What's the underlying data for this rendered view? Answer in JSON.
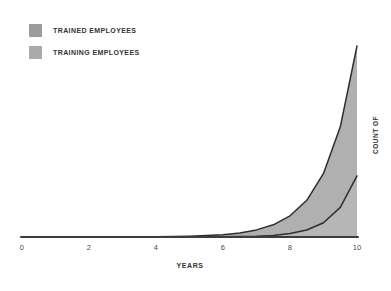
{
  "legend": {
    "items": [
      {
        "label": "TRAINED EMPLOYEES",
        "swatch_color": "#9c9c9c"
      },
      {
        "label": "TRAINING EMPLOYEES",
        "swatch_color": "#aaaaaa"
      }
    ]
  },
  "colors": {
    "trained_fill": "#b0b0b0",
    "training_fill": "#b6b6b6",
    "curve_stroke": "#2e2e2e",
    "axis_stroke": "#3d3d3d",
    "background": "#ffffff"
  },
  "chart_data": {
    "type": "area",
    "stacked": true,
    "title": "",
    "xlabel": "YEARS",
    "ylabel": "COUNT OF",
    "xlim": [
      0,
      10
    ],
    "ylim": [
      0,
      100
    ],
    "x_ticks": [
      "0",
      "2",
      "4",
      "6",
      "8",
      "10"
    ],
    "x_tick_values": [
      0,
      2,
      4,
      6,
      8,
      10
    ],
    "y_axis_ticks_visible": false,
    "legend_position": "top-left",
    "grid": false,
    "x": [
      0,
      0.5,
      1,
      1.5,
      2,
      2.5,
      3,
      3.5,
      4,
      4.5,
      5,
      5.5,
      6,
      6.5,
      7,
      7.5,
      8,
      8.5,
      9,
      9.5,
      10
    ],
    "series": [
      {
        "name": "TRAINING EMPLOYEES",
        "values": [
          0,
          0,
          0,
          0,
          0,
          0,
          0.01,
          0.01,
          0.01,
          0.01,
          0.02,
          0.05,
          0.1,
          0.2,
          0.41,
          0.85,
          1.76,
          3.64,
          7.5,
          15.5,
          32
        ]
      },
      {
        "name": "TRAINED EMPLOYEES",
        "values": [
          0,
          0.01,
          0.01,
          0.01,
          0.02,
          0.03,
          0.04,
          0.07,
          0.13,
          0.23,
          0.39,
          0.66,
          1.13,
          1.9,
          3.29,
          5.55,
          9.34,
          15.56,
          25.8,
          42.2,
          68
        ]
      }
    ]
  }
}
